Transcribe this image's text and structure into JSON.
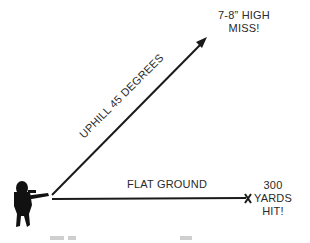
{
  "diagram": {
    "paths": [
      {
        "name": "uphill",
        "label": "UPHILL 45 DEGREES",
        "angle_degrees": 45
      },
      {
        "name": "flat",
        "label": "FLAT GROUND"
      }
    ],
    "outcomes": {
      "uphill": {
        "line1": "7-8” HIGH",
        "line2": "MISS!"
      },
      "flat": {
        "line1": "300",
        "line2": "YARDS",
        "line3": "HIT!"
      }
    },
    "colors": {
      "line": "#1a1a1a",
      "text": "#2a2a2a",
      "background": "#ffffff"
    }
  }
}
